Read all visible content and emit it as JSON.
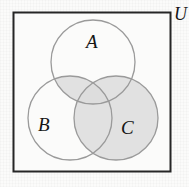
{
  "figure": {
    "kind": "venn-diagram",
    "universe_label": "U",
    "background_color": "#fbfbfa",
    "border_color": "#262626",
    "circle_stroke_color": "#9a9a9a",
    "shade_color": "#dcdcdc",
    "labels": {
      "a": "A",
      "b": "B",
      "c": "C",
      "u": "U"
    },
    "universe": {
      "x": 13,
      "y": 12,
      "width": 158,
      "height": 160
    },
    "sets": [
      {
        "name": "A",
        "label": "A",
        "cx": 93,
        "cy": 62,
        "r": 42
      },
      {
        "name": "B",
        "label": "B",
        "cx": 70,
        "cy": 118,
        "r": 42
      },
      {
        "name": "C",
        "label": "C",
        "cx": 116,
        "cy": 118,
        "r": 42
      }
    ],
    "shaded_expression": "C ∪ (A ∩ B)",
    "shaded_regions": [
      "C only",
      "A ∩ C",
      "B ∩ C",
      "A ∩ B ∩ C",
      "A ∩ B"
    ],
    "unshaded_regions": [
      "A only",
      "B only",
      "U outside A ∪ B ∪ C"
    ]
  }
}
